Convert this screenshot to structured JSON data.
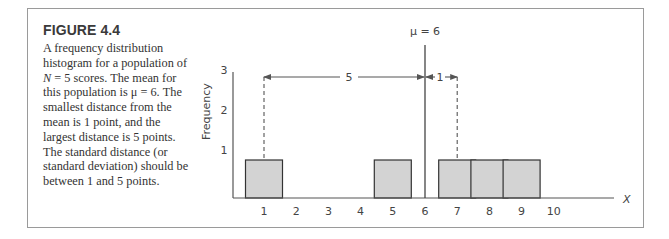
{
  "figure": {
    "title": "FIGURE 4.4",
    "caption_parts": {
      "p1": "A frequency distribution histogram for a population of ",
      "n_symbol": "N",
      "p2": " = 5 scores. The mean for this population is μ = 6. The smallest distance from the mean is 1 point, and the largest distance is 5 points. The standard distance (or standard deviation) should be between 1 and 5 points."
    }
  },
  "chart_data": {
    "type": "bar",
    "title": "",
    "xlabel": "X",
    "ylabel": "Frequency",
    "x_ticks": [
      "1",
      "2",
      "3",
      "4",
      "5",
      "6",
      "7",
      "8",
      "9",
      "10"
    ],
    "y_ticks": [
      "1",
      "2",
      "3"
    ],
    "ylim": [
      0,
      3.5
    ],
    "categories": [
      1,
      5,
      7,
      8,
      9
    ],
    "values": [
      1,
      1,
      1,
      1,
      1
    ],
    "grid": false,
    "annotations": {
      "mean_label": "μ = 6",
      "mean_value": 6,
      "largest_distance_label": "5",
      "smallest_distance_label": "1"
    }
  }
}
